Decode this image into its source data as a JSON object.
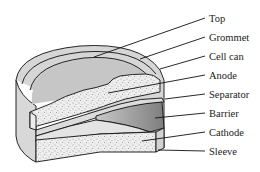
{
  "diagram": {
    "labels": [
      {
        "id": "top",
        "text": "Top"
      },
      {
        "id": "grommet",
        "text": "Grommet"
      },
      {
        "id": "cell-can",
        "text": "Cell can"
      },
      {
        "id": "anode",
        "text": "Anode"
      },
      {
        "id": "separator",
        "text": "Separator"
      },
      {
        "id": "barrier",
        "text": "Barrier"
      },
      {
        "id": "cathode",
        "text": "Cathode"
      },
      {
        "id": "sleeve",
        "text": "Sleeve"
      }
    ],
    "colors": {
      "top_surface": "#c9c9c9",
      "rim": "#d6d6d6",
      "speckled_fill": "#ececec",
      "barrier": "#9a9a9a",
      "outline": "#111111"
    }
  }
}
